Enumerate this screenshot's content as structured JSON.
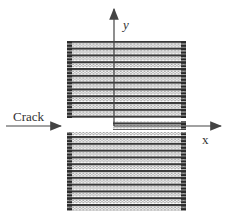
{
  "diagram": {
    "labels": {
      "crack": "Crack",
      "x_axis": "x",
      "y_axis": "y"
    },
    "lattice": {
      "left": 67,
      "right": 186,
      "top_block": {
        "top": 41,
        "bottom": 118
      },
      "bottom_block": {
        "top": 132,
        "bottom": 211
      },
      "bridge_right_of_tip": {
        "left": 113,
        "top": 122,
        "bottom": 129
      },
      "row_pitch": 3.4,
      "atom_color_dark": "#3a3a3a",
      "atom_color_light": "#9a9a9a"
    },
    "axes": {
      "origin": {
        "x": 114,
        "y": 126
      },
      "y_axis_top": 8,
      "x_axis_right": 222,
      "color": "#444444"
    },
    "crack_arrow": {
      "x_start": 6,
      "x_end": 62,
      "y": 126
    }
  }
}
